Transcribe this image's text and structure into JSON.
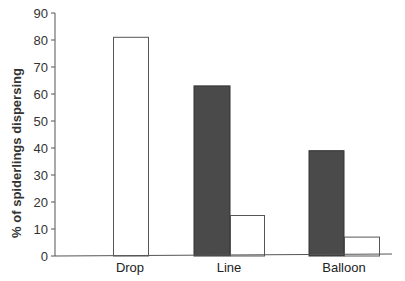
{
  "chart_data": {
    "type": "bar",
    "title": "",
    "xlabel": "",
    "ylabel": "% of spiderlings dispersing",
    "ylim": [
      0,
      90
    ],
    "yticks": [
      0,
      10,
      20,
      30,
      40,
      50,
      60,
      70,
      80,
      90
    ],
    "categories": [
      "Drop",
      "Line",
      "Balloon"
    ],
    "series": [
      {
        "name": "dark",
        "color": "#4a4a4a",
        "values": [
          null,
          63,
          39
        ]
      },
      {
        "name": "white",
        "color": "#ffffff",
        "values": [
          81,
          15,
          7
        ]
      }
    ],
    "grid": false,
    "legend": null
  },
  "labels": {
    "ylabel": "% of spiderlings dispersing",
    "categories": [
      "Drop",
      "Line",
      "Balloon"
    ],
    "yticks": [
      "0",
      "10",
      "20",
      "30",
      "40",
      "50",
      "60",
      "70",
      "80",
      "90"
    ]
  }
}
